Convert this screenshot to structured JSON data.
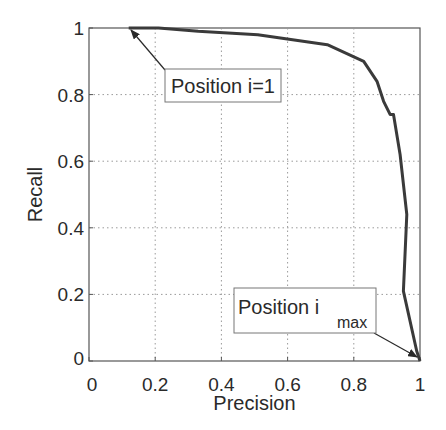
{
  "chart_data": {
    "type": "line",
    "title": "",
    "xlabel": "Precision",
    "ylabel": "Recall",
    "xlim": [
      0,
      1
    ],
    "ylim": [
      0,
      1
    ],
    "xticks": [
      "0",
      "0.2",
      "0.4",
      "0.6",
      "0.8",
      "1"
    ],
    "yticks": [
      "0",
      "0.2",
      "0.4",
      "0.6",
      "0.8",
      "1"
    ],
    "grid": true,
    "legend": null,
    "series": [
      {
        "name": "precision-recall curve",
        "color": "#3a3a3a",
        "x": [
          0.12,
          0.21,
          0.33,
          0.51,
          0.72,
          0.83,
          0.87,
          0.89,
          0.91,
          0.92,
          0.94,
          0.96,
          0.95,
          0.99,
          1.0
        ],
        "y": [
          1.0,
          1.0,
          0.99,
          0.98,
          0.95,
          0.9,
          0.84,
          0.78,
          0.74,
          0.74,
          0.62,
          0.44,
          0.21,
          0.03,
          0.0
        ]
      }
    ],
    "annotations": [
      {
        "text": "Position i=1",
        "subscript": "",
        "points_to": [
          0.12,
          1.0
        ]
      },
      {
        "text": "Position i",
        "subscript": "max",
        "points_to": [
          1.0,
          0.0
        ]
      }
    ]
  }
}
